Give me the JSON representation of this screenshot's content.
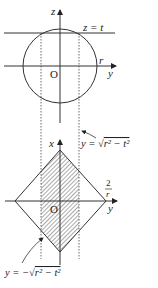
{
  "colors": {
    "stroke": "#333333",
    "hatch": "#555555",
    "background": "#ffffff"
  },
  "top_plot": {
    "vertical_axis_label": "z",
    "horizontal_axis_label": "y",
    "origin_label": "O",
    "radius_label": "r",
    "plane_label": "z = t"
  },
  "annotation_upper": {
    "prefix": "y = ",
    "sqrt": "√",
    "radicand": "r² − t²"
  },
  "bottom_plot": {
    "vertical_axis_label": "x",
    "horizontal_axis_label": "y",
    "origin_label": "O",
    "vertex_label_top": "2",
    "vertex_label_bottom": "r"
  },
  "annotation_lower": {
    "prefix": "y = −",
    "sqrt": "√",
    "radicand": "r² − t²"
  }
}
